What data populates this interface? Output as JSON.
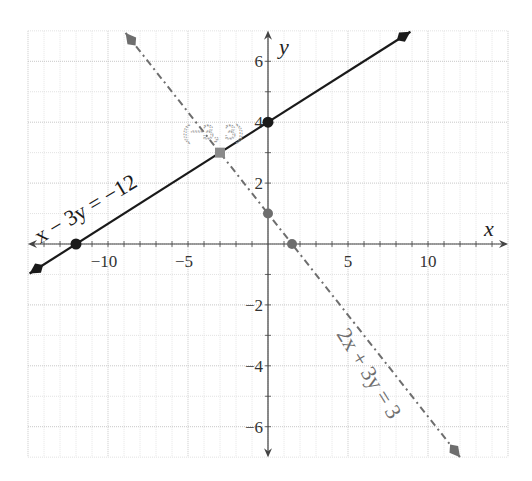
{
  "chart_data": {
    "type": "line",
    "title": "",
    "xlabel": "x",
    "ylabel": "y",
    "xlim": [
      -15,
      15
    ],
    "ylim": [
      -7,
      7
    ],
    "grid": true,
    "x_ticks": [
      -10,
      -5,
      5,
      10
    ],
    "x_tick_labels": [
      "−10",
      "−5",
      "5",
      "10"
    ],
    "y_ticks": [
      -6,
      -4,
      -2,
      2,
      4,
      6
    ],
    "y_tick_labels": [
      "−6",
      "−4",
      "−2",
      "2",
      "4",
      "6"
    ],
    "series": [
      {
        "name": "x − 3y = −12",
        "equation": "x - 3y = -12",
        "style": "solid",
        "color": "#1a1a1a",
        "x": [
          -14.9,
          8.9
        ],
        "y": [
          -0.97,
          6.97
        ],
        "points": [
          {
            "x": -12,
            "y": 0
          },
          {
            "x": 0,
            "y": 4
          }
        ]
      },
      {
        "name": "2x + 3y = 3",
        "equation": "2x + 3y = 3",
        "style": "dash-dot",
        "color": "#6e6e6e",
        "x": [
          -8.9,
          12
        ],
        "y": [
          6.93,
          -7
        ],
        "points": [
          {
            "x": 0,
            "y": 1
          },
          {
            "x": 1.5,
            "y": 0
          }
        ]
      }
    ],
    "annotations": [
      {
        "text": "(−3, 3)",
        "x": -3,
        "y": 3,
        "note": "intersection point"
      }
    ]
  },
  "labels": {
    "x_axis": "x",
    "y_axis": "y",
    "line1": "x − 3y = −12",
    "line2": "2x + 3y = 3",
    "intersection": "(−3, 3)"
  },
  "colors": {
    "line1": "#1a1a1a",
    "line2": "#6e6e6e",
    "intersection": "#8a8a8a",
    "grid": "#d4d4d4",
    "axis": "#444444"
  }
}
